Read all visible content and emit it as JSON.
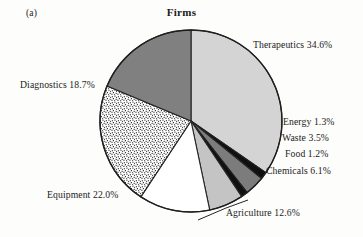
{
  "figure": {
    "panel_label": "(a)",
    "title": "Firms",
    "background_color": "#fdfdfc"
  },
  "chart_data": {
    "type": "pie",
    "title": "Firms",
    "panel": "(a)",
    "xlabel": "",
    "ylabel": "",
    "legend_position": "outside-labels",
    "grid": false,
    "unit": "percent",
    "total": 100.0,
    "start_angle_deg": 0,
    "direction": "clockwise",
    "categories": [
      "Therapeutics",
      "Energy",
      "Waste",
      "Food",
      "Chemicals",
      "Agriculture",
      "Equipment",
      "Diagnostics"
    ],
    "values": [
      34.6,
      1.3,
      3.5,
      1.2,
      6.1,
      12.6,
      22.0,
      18.7
    ],
    "slices": [
      {
        "label": "Therapeutics 34.6%",
        "name": "Therapeutics",
        "value": 34.6,
        "color": "#d4d4d4",
        "pattern": "solid"
      },
      {
        "label": "Energy 1.3%",
        "name": "Energy",
        "value": 1.3,
        "color": "#101010",
        "pattern": "solid"
      },
      {
        "label": "Waste 3.5%",
        "name": "Waste",
        "value": 3.5,
        "color": "#7c7c7c",
        "pattern": "solid"
      },
      {
        "label": "Food 1.2%",
        "name": "Food",
        "value": 1.2,
        "color": "#101010",
        "pattern": "solid"
      },
      {
        "label": "Chemicals 6.1%",
        "name": "Chemicals",
        "value": 6.1,
        "color": "#c4c4c4",
        "pattern": "solid"
      },
      {
        "label": "Agriculture 12.6%",
        "name": "Agriculture",
        "value": 12.6,
        "color": "#ffffff",
        "pattern": "solid"
      },
      {
        "label": "Equipment 22.0%",
        "name": "Equipment",
        "value": 22.0,
        "color": "#ffffff",
        "pattern": "stipple"
      },
      {
        "label": "Diagnostics 18.7%",
        "name": "Diagnostics",
        "value": 18.7,
        "color": "#808080",
        "pattern": "solid"
      }
    ]
  }
}
